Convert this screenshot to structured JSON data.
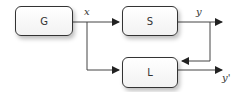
{
  "blocks": {
    "g": "G",
    "s": "S",
    "l": "L"
  },
  "signals": {
    "x": "x",
    "y": "y",
    "y_prime": "y'"
  }
}
